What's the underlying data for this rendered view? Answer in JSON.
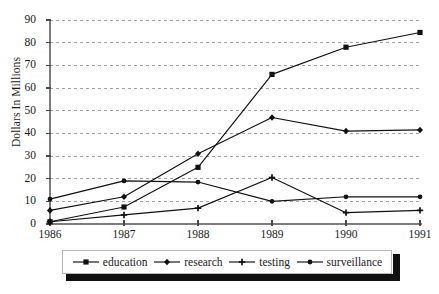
{
  "figure": {
    "background": "#ffffff",
    "plot_area": {
      "left": 50,
      "top": 20,
      "right": 420,
      "bottom": 224
    }
  },
  "axes": {
    "ylabel": "Dollars In Millions",
    "yticks": [
      0,
      10,
      20,
      30,
      40,
      50,
      60,
      70,
      80,
      90
    ],
    "xticks": [
      "1986",
      "1987",
      "1988",
      "1989",
      "1990",
      "1991"
    ]
  },
  "legend": {
    "entries": [
      {
        "label": "education",
        "marker": "square",
        "color": "#111111"
      },
      {
        "label": "research",
        "marker": "diamond",
        "color": "#111111"
      },
      {
        "label": "testing",
        "marker": "cross",
        "color": "#111111"
      },
      {
        "label": "surveillance",
        "marker": "dot",
        "color": "#111111"
      }
    ]
  },
  "chart_data": {
    "type": "line",
    "title": "",
    "xlabel": "",
    "ylabel": "Dollars In Millions",
    "categories": [
      "1986",
      "1987",
      "1988",
      "1989",
      "1990",
      "1991"
    ],
    "x": [
      1986,
      1987,
      1988,
      1989,
      1990,
      1991
    ],
    "ylim": [
      0,
      90
    ],
    "ytick_step": 10,
    "grid": true,
    "grid_style": "dashed-horizontal",
    "legend_position": "below",
    "series": [
      {
        "name": "education",
        "marker": "square",
        "color": "#111111",
        "values": [
          1,
          7.5,
          25,
          66,
          78,
          84.5
        ]
      },
      {
        "name": "research",
        "marker": "diamond",
        "color": "#111111",
        "values": [
          6,
          12,
          31,
          47,
          41,
          41.5
        ]
      },
      {
        "name": "testing",
        "marker": "cross",
        "color": "#111111",
        "values": [
          1,
          4,
          7,
          20.5,
          5,
          6
        ]
      },
      {
        "name": "surveillance",
        "marker": "dot",
        "color": "#111111",
        "values": [
          11,
          19,
          18.5,
          10,
          12,
          12
        ]
      }
    ]
  }
}
